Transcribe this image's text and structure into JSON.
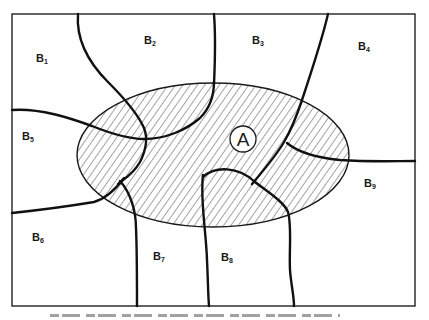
{
  "diagram": {
    "type": "region-overlap-map",
    "frame": {
      "x": 12,
      "y": 14,
      "width": 403,
      "height": 292
    },
    "overlay_region": {
      "label": "A",
      "style": "hatched",
      "ellipse": {
        "cx": 213,
        "cy": 155,
        "rx": 136,
        "ry": 72
      },
      "label_circle": {
        "cx": 243,
        "cy": 139,
        "r": 13
      }
    },
    "regions": [
      {
        "id": "B1",
        "letter": "B",
        "subscript": "1",
        "x": 36,
        "y": 62
      },
      {
        "id": "B2",
        "letter": "B",
        "subscript": "2",
        "x": 144,
        "y": 44
      },
      {
        "id": "B3",
        "letter": "B",
        "subscript": "3",
        "x": 252,
        "y": 44
      },
      {
        "id": "B4",
        "letter": "B",
        "subscript": "4",
        "x": 358,
        "y": 50
      },
      {
        "id": "B5",
        "letter": "B",
        "subscript": "5",
        "x": 22,
        "y": 140
      },
      {
        "id": "B6",
        "letter": "B",
        "subscript": "6",
        "x": 32,
        "y": 241
      },
      {
        "id": "B7",
        "letter": "B",
        "subscript": "7",
        "x": 153,
        "y": 260
      },
      {
        "id": "B8",
        "letter": "B",
        "subscript": "8",
        "x": 221,
        "y": 261
      },
      {
        "id": "B9",
        "letter": "B",
        "subscript": "9",
        "x": 364,
        "y": 187
      }
    ],
    "colors": {
      "line": "#111111",
      "background": "#ffffff",
      "hatch": "#333333"
    },
    "caption": {
      "visible": "truncated (unreadable, cut off at bottom edge)"
    }
  }
}
